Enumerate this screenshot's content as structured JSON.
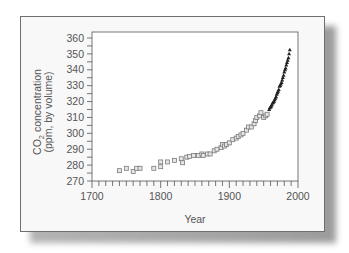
{
  "chart_data": {
    "type": "scatter",
    "title": "",
    "xlabel": "Year",
    "ylabel_line1": "CO2 concentration",
    "ylabel_line2": "(ppm, by volume)",
    "ylabel": "CO2 concentration (ppm, by volume)",
    "xlim": [
      1700,
      2000
    ],
    "ylim": [
      270,
      360
    ],
    "x_ticks": [
      1700,
      1800,
      1900,
      2000
    ],
    "y_ticks": [
      270,
      280,
      290,
      300,
      310,
      320,
      330,
      340,
      350,
      360
    ],
    "x_minor_step": 10,
    "y_minor_step": 5,
    "grid": false,
    "legend": null,
    "series": [
      {
        "name": "ice core (squares)",
        "marker": "square",
        "points": [
          [
            1740,
            276.5
          ],
          [
            1750,
            278
          ],
          [
            1760,
            276
          ],
          [
            1765,
            278
          ],
          [
            1770,
            278
          ],
          [
            1790,
            278
          ],
          [
            1800,
            279
          ],
          [
            1800,
            282
          ],
          [
            1810,
            282
          ],
          [
            1820,
            283
          ],
          [
            1830,
            284
          ],
          [
            1832,
            281.5
          ],
          [
            1838,
            285
          ],
          [
            1842,
            285.5
          ],
          [
            1848,
            286
          ],
          [
            1855,
            286
          ],
          [
            1860,
            287
          ],
          [
            1862,
            286
          ],
          [
            1868,
            287
          ],
          [
            1872,
            287
          ],
          [
            1878,
            289
          ],
          [
            1882,
            290
          ],
          [
            1888,
            291
          ],
          [
            1890,
            293
          ],
          [
            1893,
            292
          ],
          [
            1896,
            293
          ],
          [
            1900,
            294
          ],
          [
            1905,
            296
          ],
          [
            1910,
            297
          ],
          [
            1913,
            298
          ],
          [
            1917,
            299
          ],
          [
            1920,
            300
          ],
          [
            1925,
            302
          ],
          [
            1928,
            304
          ],
          [
            1932,
            304
          ],
          [
            1936,
            306
          ],
          [
            1938,
            308
          ],
          [
            1940,
            310
          ],
          [
            1944,
            311
          ],
          [
            1946,
            313
          ],
          [
            1950,
            310
          ],
          [
            1953,
            311
          ],
          [
            1955,
            312
          ]
        ]
      },
      {
        "name": "atmospheric (triangles)",
        "marker": "triangle",
        "points": [
          [
            1958,
            315
          ],
          [
            1959,
            316
          ],
          [
            1960,
            316.5
          ],
          [
            1961,
            317
          ],
          [
            1962,
            318
          ],
          [
            1963,
            319
          ],
          [
            1964,
            319.5
          ],
          [
            1965,
            320
          ],
          [
            1966,
            321
          ],
          [
            1967,
            322
          ],
          [
            1968,
            323
          ],
          [
            1969,
            324.5
          ],
          [
            1970,
            325.5
          ],
          [
            1971,
            326.5
          ],
          [
            1972,
            327.5
          ],
          [
            1973,
            329.5
          ],
          [
            1974,
            330
          ],
          [
            1975,
            331
          ],
          [
            1976,
            332
          ],
          [
            1977,
            333.5
          ],
          [
            1978,
            335
          ],
          [
            1979,
            336.5
          ],
          [
            1980,
            338.5
          ],
          [
            1981,
            340
          ],
          [
            1982,
            341
          ],
          [
            1983,
            343
          ],
          [
            1984,
            344.5
          ],
          [
            1985,
            346
          ],
          [
            1986,
            347.5
          ],
          [
            1987,
            350
          ],
          [
            1988,
            352.5
          ]
        ]
      }
    ]
  },
  "labels": {
    "x_title": "Year",
    "y_title_line1_main": "CO",
    "y_title_line1_sub": "2",
    "y_title_line1_rest": " concentration",
    "y_title_line2": "(ppm, by volume)"
  }
}
